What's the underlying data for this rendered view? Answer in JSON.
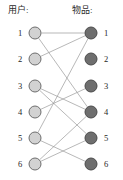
{
  "figure": {
    "title_users": "用户:",
    "title_items": "物品:",
    "edge_color": "#9a9a9a",
    "user_node_color": "#d2d2d2",
    "item_node_color": "#6e6e6e"
  },
  "users": [
    {
      "label": "1",
      "cx": 35,
      "cy": 33
    },
    {
      "label": "2",
      "cx": 35,
      "cy": 59
    },
    {
      "label": "3",
      "cx": 35,
      "cy": 86
    },
    {
      "label": "4",
      "cx": 35,
      "cy": 112
    },
    {
      "label": "5",
      "cx": 35,
      "cy": 138
    },
    {
      "label": "6",
      "cx": 35,
      "cy": 164
    }
  ],
  "items": [
    {
      "label": "1",
      "cx": 91,
      "cy": 33
    },
    {
      "label": "2",
      "cx": 91,
      "cy": 59
    },
    {
      "label": "3",
      "cx": 91,
      "cy": 86
    },
    {
      "label": "4",
      "cx": 91,
      "cy": 112
    },
    {
      "label": "5",
      "cx": 91,
      "cy": 138
    },
    {
      "label": "6",
      "cx": 91,
      "cy": 164
    }
  ],
  "edges": [
    {
      "user": 1,
      "item": 1
    },
    {
      "user": 1,
      "item": 4
    },
    {
      "user": 2,
      "item": 1
    },
    {
      "user": 3,
      "item": 4
    },
    {
      "user": 3,
      "item": 5
    },
    {
      "user": 4,
      "item": 3
    },
    {
      "user": 5,
      "item": 1
    },
    {
      "user": 5,
      "item": 6
    },
    {
      "user": 6,
      "item": 4
    },
    {
      "user": 6,
      "item": 5
    }
  ]
}
